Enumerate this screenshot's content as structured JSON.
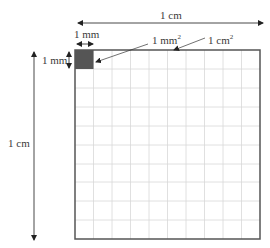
{
  "diagram": {
    "labels": {
      "top_width": "1 cm",
      "left_height": "1 cm",
      "small_width": "1 mm",
      "small_height": "1 mm",
      "small_area": "1 mm",
      "small_area_exp": "2",
      "big_area": "1 cm",
      "big_area_exp": "2"
    },
    "grid": {
      "rows": 10,
      "cols": 10
    },
    "colors": {
      "grid_line": "#d8d8d8",
      "border": "#555555",
      "filled_cell": "#555555",
      "arrow": "#333333"
    }
  }
}
